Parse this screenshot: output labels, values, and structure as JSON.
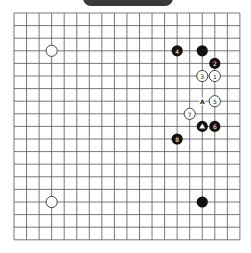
{
  "header": {
    "label": ""
  },
  "board": {
    "size": 19,
    "origin_x": 14,
    "origin_y": 13,
    "spacing_x": 12.55,
    "spacing_y": 12.6,
    "colors": {
      "line": "#555555",
      "black": "#111111",
      "white": "#ffffff"
    },
    "stones": [
      {
        "color": "white",
        "col": 3,
        "row": 3,
        "label": ""
      },
      {
        "color": "white",
        "col": 3,
        "row": 15,
        "label": ""
      },
      {
        "color": "black",
        "col": 15,
        "row": 15,
        "label": ""
      },
      {
        "color": "black",
        "col": 15,
        "row": 3,
        "label": ""
      },
      {
        "color": "black",
        "col": 13,
        "row": 3,
        "label": "4"
      },
      {
        "color": "black",
        "col": 16,
        "row": 4,
        "label": "2"
      },
      {
        "color": "white",
        "col": 16,
        "row": 5,
        "label": "1"
      },
      {
        "color": "white",
        "col": 15,
        "row": 5,
        "label": "3"
      },
      {
        "color": "white",
        "col": 16,
        "row": 7,
        "label": "5"
      },
      {
        "color": "white",
        "col": 14,
        "row": 8,
        "label": "7"
      },
      {
        "color": "black",
        "col": 15,
        "row": 9,
        "label": "triangle"
      },
      {
        "color": "black",
        "col": 16,
        "row": 9,
        "label": "6"
      },
      {
        "color": "black",
        "col": 13,
        "row": 10,
        "label": "8"
      }
    ],
    "marks": [
      {
        "col": 15,
        "row": 7,
        "text": "A"
      }
    ]
  }
}
